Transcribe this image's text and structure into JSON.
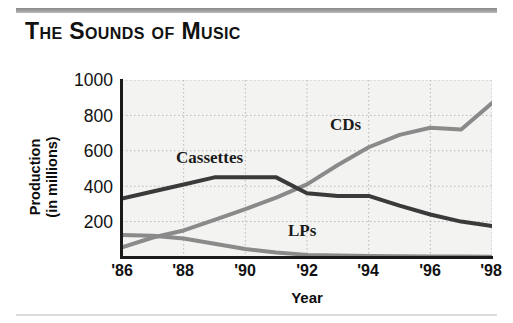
{
  "title": "The Sounds of Music",
  "chart_data": {
    "type": "line",
    "title": "The Sounds of Music",
    "xlabel": "Year",
    "ylabel": "Production (in millions)",
    "ylabel_line1": "Production",
    "ylabel_line2": "(in millions)",
    "xlim": [
      1986,
      1998
    ],
    "ylim": [
      0,
      1000
    ],
    "grid": true,
    "legend_position": "inline-labels",
    "x_tick_labels": [
      "'86",
      "'88",
      "'90",
      "'92",
      "'94",
      "'96",
      "'98"
    ],
    "x_tick_values": [
      1986,
      1988,
      1990,
      1992,
      1994,
      1996,
      1998
    ],
    "y_tick_labels": [
      "1000",
      "800",
      "600",
      "400",
      "200"
    ],
    "y_tick_values": [
      1000,
      800,
      600,
      400,
      200
    ],
    "x": [
      1986,
      1987,
      1988,
      1989,
      1990,
      1991,
      1992,
      1993,
      1994,
      1995,
      1996,
      1997,
      1998
    ],
    "series": [
      {
        "name": "Cassettes",
        "color": "#3a3a3a",
        "values": [
          330,
          370,
          410,
          450,
          450,
          450,
          360,
          345,
          345,
          290,
          240,
          200,
          175
        ]
      },
      {
        "name": "CDs",
        "color": "#8a8a8a",
        "values": [
          55,
          110,
          150,
          210,
          270,
          335,
          410,
          520,
          620,
          690,
          730,
          720,
          870
        ]
      },
      {
        "name": "LPs",
        "color": "#8a8a8a",
        "values": [
          125,
          120,
          105,
          75,
          45,
          25,
          12,
          8,
          5,
          4,
          3,
          3,
          2
        ]
      }
    ],
    "annotations": [
      {
        "text": "Cassettes",
        "x": 1989,
        "y": 520
      },
      {
        "text": "CDs",
        "x": 1993.2,
        "y": 640
      },
      {
        "text": "LPs",
        "x": 1991.8,
        "y": 130
      }
    ]
  },
  "axis": {
    "y_title_line1": "Production",
    "y_title_line2": "(in millions)",
    "x_title": "Year"
  },
  "colors": {
    "dark_series": "#3a3a3a",
    "gray_series": "#8a8a8a",
    "plot_background": "#f3f3f1",
    "gridline": "#b8b8b8",
    "axis": "#1a1a1a",
    "title_text": "#111111",
    "rule": "#9a9a9a"
  }
}
